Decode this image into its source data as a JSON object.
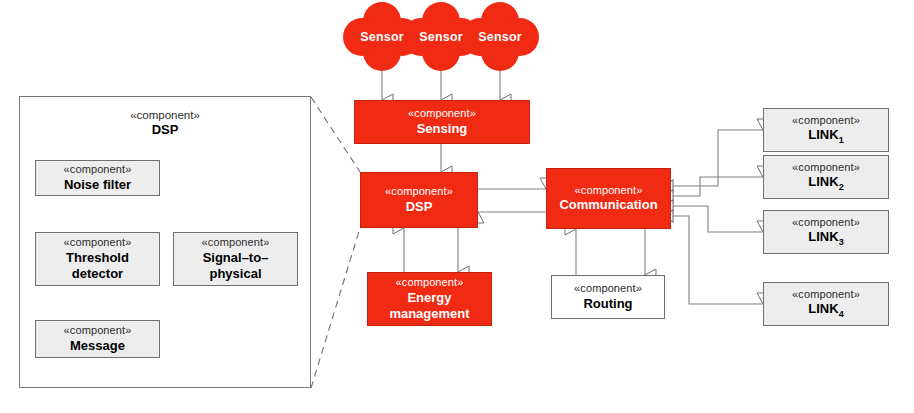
{
  "diagram": {
    "stereotype": "«component»",
    "sensors": [
      {
        "label": "Sensor"
      },
      {
        "label": "Sensor"
      },
      {
        "label": "Sensor"
      }
    ],
    "detail_panel": {
      "name": "detail-dsp-panel",
      "stereotype": "«component»",
      "title": "DSP",
      "children": [
        {
          "stereotype": "«component»",
          "name": "Noise filter"
        },
        {
          "stereotype": "«component»",
          "name_line1": "Threshold",
          "name_line2": "detector"
        },
        {
          "stereotype": "«component»",
          "name_line1": "Signal–to–",
          "name_line2": "physical"
        },
        {
          "stereotype": "«component»",
          "name": "Message"
        }
      ]
    },
    "components": [
      {
        "stereotype": "«component»",
        "name": "Sensing",
        "fill": "red"
      },
      {
        "stereotype": "«component»",
        "name": "DSP",
        "fill": "red"
      },
      {
        "stereotype": "«component»",
        "name": "Communication",
        "fill": "red"
      },
      {
        "stereotype": "«component»",
        "name_line1": "Energy",
        "name_line2": "management",
        "fill": "red"
      },
      {
        "stereotype": "«component»",
        "name": "Routing",
        "fill": "white"
      }
    ],
    "links": [
      {
        "stereotype": "«component»",
        "name": "LINK",
        "index": "1"
      },
      {
        "stereotype": "«component»",
        "name": "LINK",
        "index": "2"
      },
      {
        "stereotype": "«component»",
        "name": "LINK",
        "index": "3"
      },
      {
        "stereotype": "«component»",
        "name": "LINK",
        "index": "4"
      }
    ],
    "colors": {
      "component_red": "#f02a13",
      "component_gray": "#ededed",
      "border_gray": "#6f6f6f",
      "connector": "#808080"
    }
  }
}
